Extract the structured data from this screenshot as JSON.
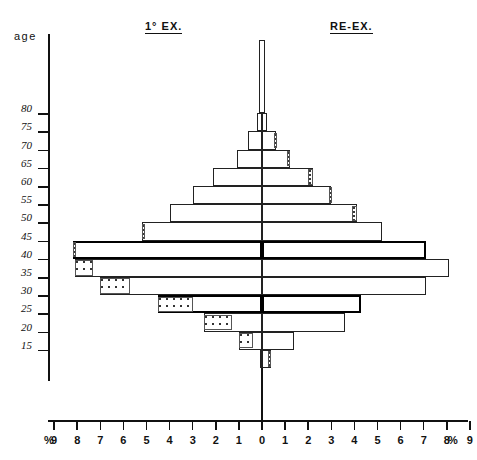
{
  "page": {
    "age_axis_label": "age",
    "left_header": "1° EX.",
    "right_header": "RE-EX.",
    "percent_symbol_left": "%",
    "percent_symbol_right": "%"
  },
  "chart_data": {
    "type": "bar",
    "title": "",
    "subtitle": "",
    "orientation": "population-pyramid",
    "xlabel": "%",
    "ylabel": "age",
    "xlim": [
      -9.5,
      9.5
    ],
    "grid": false,
    "legend_position": "top",
    "x_ticks": [
      9,
      8,
      7,
      6,
      5,
      4,
      3,
      2,
      1,
      0,
      1,
      2,
      3,
      4,
      5,
      6,
      7,
      8,
      9
    ],
    "y_ticks": [
      80,
      75,
      70,
      65,
      60,
      55,
      50,
      45,
      40,
      35,
      30,
      25,
      20,
      15
    ],
    "categories": [
      "15",
      "20",
      "25",
      "30",
      "35",
      "40",
      "45",
      "50",
      "55",
      "60",
      "65",
      "70",
      "75",
      "80"
    ],
    "series": [
      {
        "name": "1° EX.",
        "side": "left",
        "values": [
          0.1,
          1.0,
          2.5,
          4.5,
          7.0,
          8.1,
          8.2,
          5.2,
          4.0,
          3.0,
          2.1,
          1.1,
          0.6,
          0.2
        ]
      },
      {
        "name": "RE-EX.",
        "side": "right",
        "values": [
          0.4,
          1.4,
          3.6,
          4.3,
          7.1,
          8.1,
          7.1,
          5.2,
          4.1,
          3.0,
          2.2,
          1.2,
          0.6,
          0.2
        ]
      }
    ],
    "stippled_note": "Shaded/stippled end segments mark a sub-portion at the outer end of selected bars",
    "stippled_left": [
      {
        "age": "20",
        "from": 0.4,
        "to": 1.0
      },
      {
        "age": "25",
        "from": 1.3,
        "to": 2.5
      },
      {
        "age": "30",
        "from": 3.0,
        "to": 4.5
      },
      {
        "age": "35",
        "from": 5.7,
        "to": 7.0
      },
      {
        "age": "40",
        "from": 7.3,
        "to": 8.1
      },
      {
        "age": "45",
        "from": 8.1,
        "to": 8.2
      },
      {
        "age": "50",
        "from": 5.1,
        "to": 5.2
      }
    ],
    "stippled_right": [
      {
        "age": "15",
        "from": 0.25,
        "to": 0.4
      },
      {
        "age": "55",
        "from": 3.9,
        "to": 4.1
      },
      {
        "age": "60",
        "from": 2.9,
        "to": 3.0
      },
      {
        "age": "65",
        "from": 2.0,
        "to": 2.2
      },
      {
        "age": "70",
        "from": 1.1,
        "to": 1.2
      },
      {
        "age": "75",
        "from": 0.5,
        "to": 0.6
      }
    ]
  },
  "geometry": {
    "zero_x": 262,
    "unit_px": 23.1,
    "row_height": 18.2,
    "baseline_y": 368,
    "axis_left_x": 48,
    "axis_bottom_y": 420
  }
}
